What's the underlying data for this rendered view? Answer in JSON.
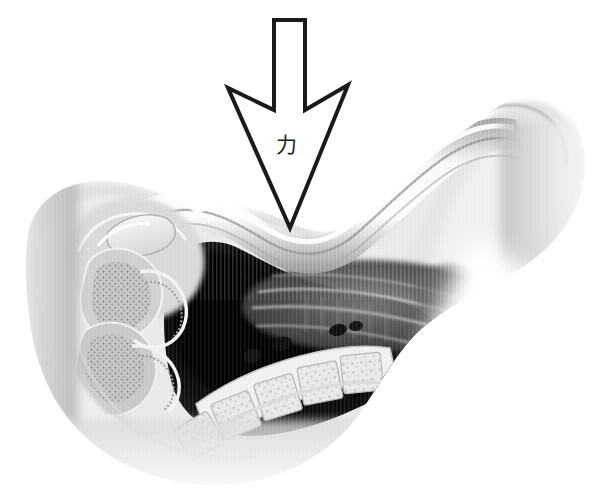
{
  "figure": {
    "name": "anatomical-sagittal-cross-section-with-force-arrow",
    "background_color": "#ffffff",
    "width": 605,
    "height": 494,
    "modality": "grayscale medical illustration / radiographic tomogram",
    "orientation": "head to the left, torso to the right, viewed in sagittal section"
  },
  "annotation": {
    "arrow": {
      "label": "力",
      "label_meaning": "force",
      "label_color": "#1a1a1a",
      "label_x": 286,
      "label_y": 152,
      "direction": "down",
      "style": "hollow outlined chevron arrow",
      "stroke_color": "#1a1a1a",
      "fill_color": "#ffffff",
      "stroke_width": 4,
      "shaft": {
        "x_left": 274,
        "x_right": 305,
        "y_top": 20,
        "y_bottom": 110
      },
      "barb_left": {
        "x": 228,
        "y": 88
      },
      "barb_right": {
        "x": 348,
        "y": 85
      },
      "notch": {
        "x": 290,
        "y": 112
      },
      "tip": {
        "x": 290,
        "y": 228
      },
      "points": "274,20 305,20 305,110 348,85 290,228 228,88 274,110"
    }
  },
  "palette": {
    "background": "#ffffff",
    "ink": "#1a1a1a",
    "cavity_black": "#0a0a0a",
    "soft_tissue_mid": "#8f8f8f",
    "soft_tissue_light": "#c9c9c9",
    "soft_tissue_pale": "#e6e6e6",
    "bone_bright": "#f2f2f2",
    "bone_outline": "#a8a8a8",
    "band_highlight": "#fbfbfb",
    "band_shadow": "#9a9a9a"
  },
  "structures": [
    {
      "id": "outer-soft-tissue-envelope",
      "label": "outer soft tissue envelope",
      "tone": "#dcdcdc",
      "region": "full silhouette spanning left skull to right shoulder"
    },
    {
      "id": "skull-base-region",
      "label": "skull base and facial bones",
      "tone": "#efefef",
      "region": "upper left, x 70-200, y 190-300"
    },
    {
      "id": "bright-bone-plate",
      "label": "bright bone plate",
      "tone": "#fafafa",
      "region": "left, x 105-165, y 212-245"
    },
    {
      "id": "nasal-oral-complex",
      "label": "nasal and oral complex with scalloped mucosa",
      "tone": "#bdbdbd",
      "region": "left, x 75-175, y 250-400"
    },
    {
      "id": "pharyngeal-air-cavity",
      "label": "pharyngeal air cavity",
      "tone": "#0a0a0a",
      "region": "central black void, x 155-420, y 225-430"
    },
    {
      "id": "curved-white-band",
      "label": "curved white band (arrow target surface)",
      "tone": "#fbfbfb",
      "region": "S-curve sweeping from x 90 to x 520 across y 180-260"
    },
    {
      "id": "cervical-vertebral-column",
      "label": "cervical vertebral column",
      "tone": "#e8e8e8",
      "region": "lower center-right, x 200-400, y 330-470"
    },
    {
      "id": "striated-muscle-planes",
      "label": "striated muscle and fascial planes",
      "tone": "#6a6a6a",
      "region": "center-right, x 250-470, y 270-350"
    },
    {
      "id": "shoulder-soft-tissue",
      "label": "shoulder soft tissue mass",
      "tone": "#e2e2e2",
      "region": "right, x 440-600, y 85-260"
    },
    {
      "id": "mandible-arch",
      "label": "mandible / jaw arch",
      "tone": "#ededed",
      "region": "lower left, x 60-260, y 380-470"
    }
  ]
}
